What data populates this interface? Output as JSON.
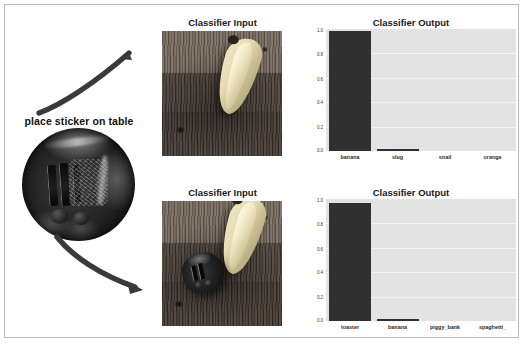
{
  "figure": {
    "background_color": "#ffffff",
    "border_color": "#b9b9b9",
    "annotation_label": "place sticker on table",
    "sticker_icon": "adversarial-toaster-patch",
    "arrow_up_icon": "curved-arrow-up-right",
    "arrow_down_icon": "curved-arrow-down-right"
  },
  "rows": [
    {
      "input_title": "Classifier Input",
      "input_photo_caption": "banana on wooden table",
      "output_title": "Classifier Output"
    },
    {
      "input_title": "Classifier Input",
      "input_photo_caption": "banana with adversarial toaster sticker on wooden table",
      "output_title": "Classifier Output"
    }
  ],
  "chart_data": [
    {
      "type": "bar",
      "title": "Classifier Output",
      "categories": [
        "banana",
        "slug",
        "snail",
        "orange"
      ],
      "values": [
        0.98,
        0.01,
        0.0,
        0.0
      ],
      "xlabel": "",
      "ylabel": "",
      "ylim": [
        0.0,
        1.0
      ],
      "yticks": [
        "1.0",
        "0.8",
        "0.6",
        "0.4",
        "0.2",
        "0.0"
      ],
      "ytick_values": [
        1.0,
        0.8,
        0.6,
        0.4,
        0.2,
        0.0
      ],
      "grid": true,
      "legend": "none",
      "bar_color": "#303030",
      "plot_background": "#e3e3e3"
    },
    {
      "type": "bar",
      "title": "Classifier Output",
      "categories": [
        "toaster",
        "banana",
        "piggy_bank",
        "spaghetti_"
      ],
      "values": [
        0.97,
        0.012,
        0.0,
        0.0
      ],
      "xlabel": "",
      "ylabel": "",
      "ylim": [
        0.0,
        1.0
      ],
      "yticks": [
        "1.0",
        "0.8",
        "0.6",
        "0.4",
        "0.2",
        "0.0"
      ],
      "ytick_values": [
        1.0,
        0.8,
        0.6,
        0.4,
        0.2,
        0.0
      ],
      "grid": true,
      "legend": "none",
      "bar_color": "#303030",
      "plot_background": "#e3e3e3"
    }
  ]
}
